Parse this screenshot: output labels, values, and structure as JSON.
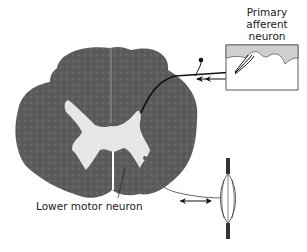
{
  "labels": {
    "primary_afferent": [
      "Primary",
      "afferent",
      "neuron"
    ],
    "lower_motor": "Lower motor neuron"
  },
  "colors": {
    "white_matter": "#5a5a5a",
    "gray_matter": "#e4e4e4",
    "skin_dermis": "#cfcfcf",
    "line": "#111111"
  }
}
